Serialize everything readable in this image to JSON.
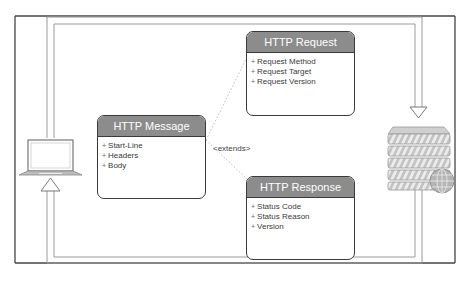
{
  "diagram": {
    "type": "http-message-flow",
    "colors": {
      "header_bg": "#8c8c8c",
      "border": "#3a3a3a",
      "pipe": "#9a9a9a",
      "frame": "#444444"
    },
    "nodes": {
      "client": {
        "icon": "laptop-icon"
      },
      "server": {
        "icon": "server-icon",
        "badge_icon": "globe-icon"
      }
    },
    "classes": {
      "message": {
        "title": "HTTP Message",
        "attributes": [
          "Start-Line",
          "Headers",
          "Body"
        ]
      },
      "request": {
        "title": "HTTP Request",
        "attributes": [
          "Request Method",
          "Request Target",
          "Request Version"
        ]
      },
      "response": {
        "title": "HTTP Response",
        "attributes": [
          "Status Code",
          "Status Reason",
          "Version"
        ]
      }
    },
    "relation_label": "<extends>"
  }
}
